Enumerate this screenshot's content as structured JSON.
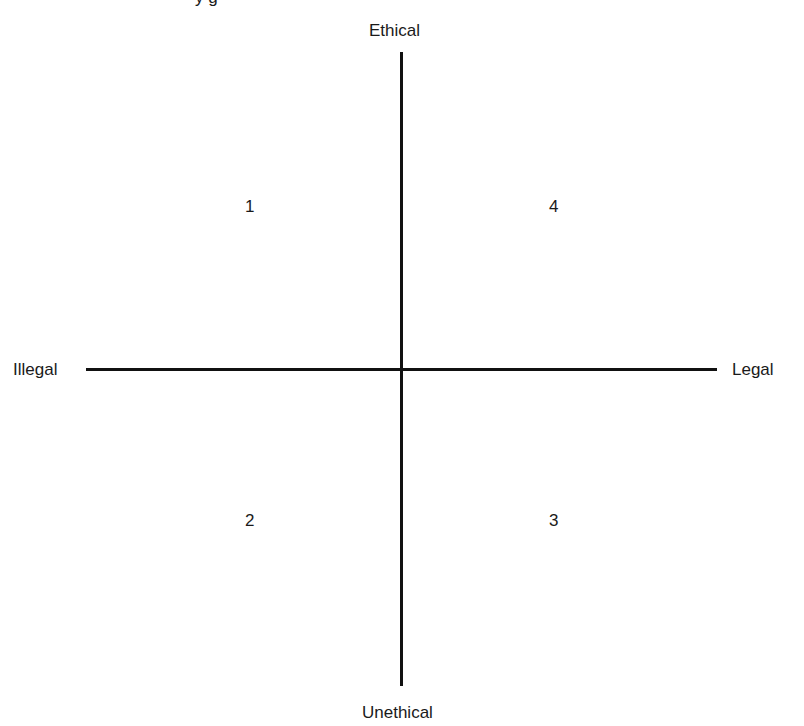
{
  "diagram": {
    "type": "quadrant",
    "top_fragment": "y g",
    "axes": {
      "top": "Ethical",
      "bottom": "Unethical",
      "left": "Illegal",
      "right": "Legal"
    },
    "quadrants": [
      {
        "position": "top-left",
        "label": "1"
      },
      {
        "position": "top-right",
        "label": "4"
      },
      {
        "position": "bottom-right",
        "label": "3"
      },
      {
        "position": "bottom-left",
        "label": "2"
      }
    ],
    "colors": {
      "line": "#111111",
      "text": "#1a1a1a",
      "background": "#ffffff"
    }
  }
}
